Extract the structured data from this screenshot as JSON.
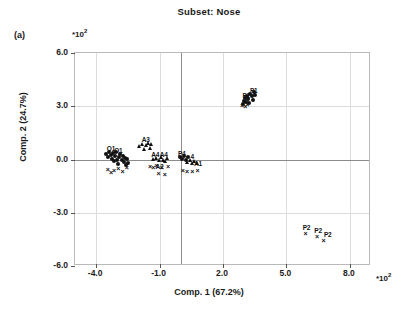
{
  "chart_data": {
    "type": "scatter",
    "title": "Subset: Nose",
    "panel_label": "(a)",
    "xlabel": "Comp. 1 (67.2%)",
    "ylabel": "Comp. 2 (24.7%)",
    "x_multiplier": "*10",
    "x_multiplier_exp": "2",
    "y_multiplier": "*10",
    "y_multiplier_exp": "2",
    "xlim": [
      -5.0,
      9.0
    ],
    "ylim": [
      -6.0,
      6.0
    ],
    "xticks": [
      "-4.0",
      "-1.0",
      "2.0",
      "5.0",
      "8.0"
    ],
    "xtick_values": [
      -4.0,
      -1.0,
      2.0,
      5.0,
      8.0
    ],
    "yticks": [
      "6.0",
      "3.0",
      "0.0",
      "-3.0",
      "-6.0"
    ],
    "ytick_values": [
      6.0,
      3.0,
      0.0,
      -3.0,
      -6.0
    ],
    "grid": true,
    "legend": "none",
    "units_note": "axis values are in units of 10^2",
    "series": [
      {
        "name": "O-group (left dense cluster)",
        "marker": "filled-circle",
        "points": [
          {
            "x": -3.55,
            "y": 0.3
          },
          {
            "x": -3.45,
            "y": 0.15
          },
          {
            "x": -3.4,
            "y": 0.45
          },
          {
            "x": -3.3,
            "y": 0.25
          },
          {
            "x": -3.25,
            "y": 0.05
          },
          {
            "x": -3.2,
            "y": 0.35
          },
          {
            "x": -3.15,
            "y": -0.1
          },
          {
            "x": -3.1,
            "y": 0.2
          },
          {
            "x": -3.05,
            "y": 0.4
          },
          {
            "x": -3.0,
            "y": 0.0
          },
          {
            "x": -2.95,
            "y": -0.25
          },
          {
            "x": -2.9,
            "y": 0.15
          },
          {
            "x": -2.85,
            "y": 0.3
          },
          {
            "x": -2.8,
            "y": -0.05
          },
          {
            "x": -2.75,
            "y": 0.2
          },
          {
            "x": -2.7,
            "y": -0.15
          },
          {
            "x": -2.65,
            "y": 0.1
          },
          {
            "x": -2.6,
            "y": -0.3
          },
          {
            "x": -2.55,
            "y": 0.05
          },
          {
            "x": -2.5,
            "y": -0.2
          }
        ]
      },
      {
        "name": "O-group crosses",
        "marker": "cross",
        "points": [
          {
            "x": -3.45,
            "y": -0.55
          },
          {
            "x": -3.3,
            "y": -0.7
          },
          {
            "x": -3.15,
            "y": -0.6
          },
          {
            "x": -2.95,
            "y": -0.5
          },
          {
            "x": -2.75,
            "y": -0.65
          },
          {
            "x": -2.55,
            "y": -0.45
          }
        ]
      },
      {
        "name": "A3-group (triangles)",
        "marker": "triangle",
        "points": [
          {
            "x": -1.95,
            "y": 0.75
          },
          {
            "x": -1.85,
            "y": 0.9
          },
          {
            "x": -1.75,
            "y": 0.6
          },
          {
            "x": -1.65,
            "y": 0.8
          },
          {
            "x": -1.55,
            "y": 0.95
          },
          {
            "x": -1.45,
            "y": 0.65
          },
          {
            "x": -1.4,
            "y": 0.85
          }
        ]
      },
      {
        "name": "A4-group",
        "marker": "triangle",
        "points": [
          {
            "x": -1.3,
            "y": 0.05
          },
          {
            "x": -1.15,
            "y": 0.1
          },
          {
            "x": -1.05,
            "y": -0.05
          },
          {
            "x": -0.95,
            "y": 0.15
          },
          {
            "x": -0.85,
            "y": 0.0
          },
          {
            "x": -0.75,
            "y": -0.1
          },
          {
            "x": -0.65,
            "y": 0.08
          }
        ]
      },
      {
        "name": "A-group crosses",
        "marker": "cross",
        "points": [
          {
            "x": -1.45,
            "y": -0.35
          },
          {
            "x": -1.3,
            "y": -0.4
          },
          {
            "x": -1.15,
            "y": -0.3
          },
          {
            "x": -1.05,
            "y": -0.75
          },
          {
            "x": -0.9,
            "y": -0.45
          },
          {
            "x": -0.75,
            "y": -0.8
          },
          {
            "x": -0.6,
            "y": -0.35
          }
        ]
      },
      {
        "name": "P4-group",
        "marker": "filled-circle",
        "points": [
          {
            "x": -0.05,
            "y": 0.15
          },
          {
            "x": 0.05,
            "y": 0.05
          },
          {
            "x": 0.15,
            "y": 0.2
          },
          {
            "x": 0.25,
            "y": 0.0
          },
          {
            "x": 0.35,
            "y": 0.12
          }
        ]
      },
      {
        "name": "A1-group",
        "marker": "triangle",
        "points": [
          {
            "x": 0.3,
            "y": -0.15
          },
          {
            "x": 0.45,
            "y": -0.05
          },
          {
            "x": 0.55,
            "y": -0.2
          },
          {
            "x": 0.65,
            "y": -0.08
          },
          {
            "x": 0.75,
            "y": -0.18
          }
        ]
      },
      {
        "name": "centre crosses",
        "marker": "cross",
        "points": [
          {
            "x": 0.1,
            "y": -0.6
          },
          {
            "x": 0.3,
            "y": -0.65
          },
          {
            "x": 0.55,
            "y": -0.62
          },
          {
            "x": 0.8,
            "y": -0.58
          }
        ]
      },
      {
        "name": "P1-group (upper right)",
        "marker": "filled-circle",
        "points": [
          {
            "x": 2.95,
            "y": 3.1
          },
          {
            "x": 3.0,
            "y": 3.3
          },
          {
            "x": 3.1,
            "y": 3.25
          },
          {
            "x": 3.15,
            "y": 3.55
          },
          {
            "x": 3.2,
            "y": 3.4
          },
          {
            "x": 3.3,
            "y": 3.7
          },
          {
            "x": 3.35,
            "y": 3.55
          },
          {
            "x": 3.45,
            "y": 3.8
          },
          {
            "x": 3.5,
            "y": 3.65
          },
          {
            "x": 3.25,
            "y": 3.2
          },
          {
            "x": 3.05,
            "y": 3.45
          },
          {
            "x": 3.4,
            "y": 3.35
          }
        ]
      },
      {
        "name": "P1-group crosses",
        "marker": "cross",
        "points": [
          {
            "x": 2.9,
            "y": 3.05
          },
          {
            "x": 3.05,
            "y": 3.0
          },
          {
            "x": 3.15,
            "y": 3.15
          }
        ]
      },
      {
        "name": "P2-group (lower right)",
        "marker": "cross",
        "points": [
          {
            "x": 5.9,
            "y": -4.15
          },
          {
            "x": 6.45,
            "y": -4.3
          },
          {
            "x": 6.75,
            "y": -4.55
          }
        ]
      }
    ],
    "point_labels": [
      {
        "text": "O1",
        "x": -3.3,
        "y": 0.62
      },
      {
        "text": "O1",
        "x": -2.95,
        "y": 0.55
      },
      {
        "text": "A3",
        "x": -1.65,
        "y": 1.15
      },
      {
        "text": "A4",
        "x": -1.2,
        "y": 0.32
      },
      {
        "text": "A4",
        "x": -0.8,
        "y": 0.32
      },
      {
        "text": "A2",
        "x": -1.0,
        "y": -0.38
      },
      {
        "text": "P4",
        "x": 0.05,
        "y": 0.38
      },
      {
        "text": "4",
        "x": 0.55,
        "y": 0.18
      },
      {
        "text": "A1",
        "x": 0.82,
        "y": -0.18
      },
      {
        "text": "P1",
        "x": 3.45,
        "y": 3.92
      },
      {
        "text": "P1",
        "x": 3.1,
        "y": 3.62
      },
      {
        "text": "P2",
        "x": 5.95,
        "y": -3.78
      },
      {
        "text": "P2",
        "x": 6.5,
        "y": -3.95
      },
      {
        "text": "P2",
        "x": 6.95,
        "y": -4.18
      }
    ]
  }
}
